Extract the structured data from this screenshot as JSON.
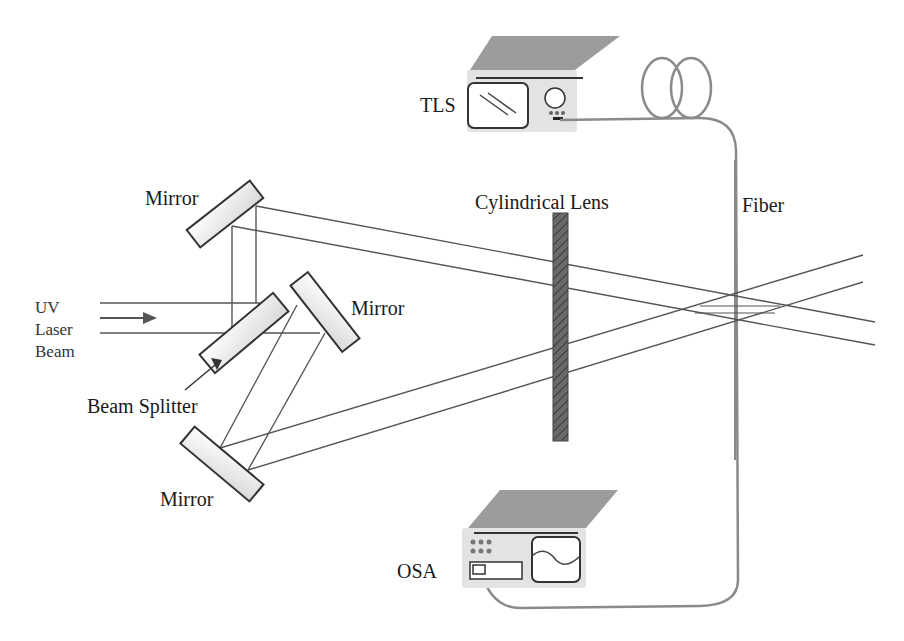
{
  "diagram": {
    "labels": {
      "tls": "TLS",
      "osa": "OSA",
      "fiber": "Fiber",
      "cylindrical_lens": "Cylindrical Lens",
      "mirror_top": "Mirror",
      "mirror_right": "Mirror",
      "mirror_bottom": "Mirror",
      "uv": "UV",
      "laser": "Laser",
      "beam": "Beam",
      "beam_splitter": "Beam Splitter"
    },
    "components": [
      {
        "id": "tls",
        "name": "Tunable Laser Source",
        "label": "TLS"
      },
      {
        "id": "osa",
        "name": "Optical Spectrum Analyzer",
        "label": "OSA"
      },
      {
        "id": "fiber",
        "label": "Fiber"
      },
      {
        "id": "lens",
        "label": "Cylindrical Lens"
      },
      {
        "id": "beam-splitter",
        "label": "Beam Splitter"
      },
      {
        "id": "mirror-1",
        "label": "Mirror"
      },
      {
        "id": "mirror-2",
        "label": "Mirror"
      },
      {
        "id": "mirror-3",
        "label": "Mirror"
      }
    ],
    "colors": {
      "line": "#555555",
      "lens": "#666666",
      "device_top": "#9a9a9a",
      "device_front": "#e2e2e2",
      "fiber": "#8a8a8a"
    }
  }
}
